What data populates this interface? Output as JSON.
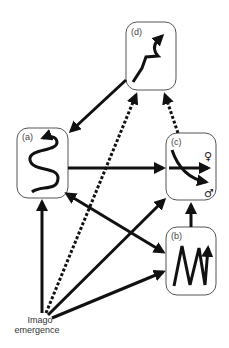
{
  "diagram": {
    "colors": {
      "ink": "#111111",
      "box_stroke": "#555555",
      "background": "#ffffff"
    },
    "boxes": [
      {
        "id": "d",
        "label": "(d)",
        "glyph": "zigzag-up-curve-arrow-icon"
      },
      {
        "id": "a",
        "label": "(a)",
        "glyph": "serpentine-arrow-icon"
      },
      {
        "id": "c",
        "label": "(c)",
        "glyph": "diverging-arrows-icon",
        "symbols": {
          "female": "♀",
          "male": "♂"
        }
      },
      {
        "id": "b",
        "label": "(b)",
        "glyph": "oscillating-zigzag-arrow-icon"
      }
    ],
    "origin": {
      "line1": "Imago",
      "line2": "emergence"
    },
    "edges": [
      {
        "from": "d",
        "to": "a",
        "style": "solid"
      },
      {
        "from": "a",
        "to": "c",
        "style": "solid"
      },
      {
        "from": "a",
        "to": "b",
        "style": "solid",
        "bidirectional": true
      },
      {
        "from": "b",
        "to": "c",
        "style": "solid"
      },
      {
        "from": "c",
        "to": "d",
        "style": "dashed"
      },
      {
        "from": "origin",
        "to": "a",
        "style": "solid"
      },
      {
        "from": "origin",
        "to": "d",
        "style": "dashed"
      },
      {
        "from": "origin",
        "to": "c",
        "style": "solid"
      },
      {
        "from": "origin",
        "to": "b",
        "style": "solid"
      }
    ]
  }
}
